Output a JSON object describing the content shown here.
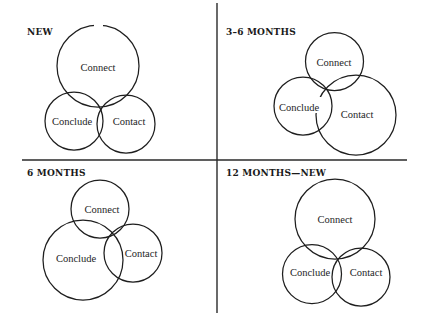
{
  "panels": [
    {
      "title": "NEW",
      "circles": [
        {
          "label": "Connect",
          "cx": 98,
          "cy": 66,
          "r": 41,
          "tx": 98,
          "ty": 71
        },
        {
          "label": "Conclude",
          "cx": 74,
          "cy": 121,
          "r": 29,
          "tx": 72,
          "ty": 125
        },
        {
          "label": "Contact",
          "cx": 126,
          "cy": 124,
          "r": 29,
          "tx": 129,
          "ty": 125
        }
      ]
    },
    {
      "title": "3–6 MONTHS",
      "circles": [
        {
          "label": "Connect",
          "cx": 334.5,
          "cy": 61.5,
          "r": 29,
          "tx": 334,
          "ty": 66
        },
        {
          "label": "Conclude",
          "cx": 303,
          "cy": 106,
          "r": 29,
          "tx": 299,
          "ty": 111
        },
        {
          "label": "Contact",
          "cx": 356,
          "cy": 115,
          "r": 40,
          "tx": 357,
          "ty": 118
        }
      ]
    },
    {
      "title": "6 MONTHS",
      "circles": [
        {
          "label": "Connect",
          "cx": 100,
          "cy": 209,
          "r": 29,
          "tx": 102,
          "ty": 213
        },
        {
          "label": "Conclude",
          "cx": 83,
          "cy": 260,
          "r": 40,
          "tx": 76,
          "ty": 262
        },
        {
          "label": "Contact",
          "cx": 133,
          "cy": 253,
          "r": 29,
          "tx": 141,
          "ty": 257
        }
      ]
    },
    {
      "title": "12 MONTHS—NEW",
      "circles": [
        {
          "label": "Connect",
          "cx": 335,
          "cy": 219,
          "r": 40,
          "tx": 335,
          "ty": 223
        },
        {
          "label": "Conclude",
          "cx": 312,
          "cy": 274,
          "r": 29.5,
          "tx": 310,
          "ty": 276
        },
        {
          "label": "Contact",
          "cx": 361,
          "cy": 277,
          "r": 29,
          "tx": 366,
          "ty": 276
        }
      ]
    }
  ],
  "dividers": {
    "horizontal": {
      "x1": 22,
      "y1": 160,
      "x2": 407,
      "y2": 160
    },
    "vertical": {
      "x1": 217,
      "y1": 3,
      "x2": 217,
      "y2": 313
    }
  },
  "colors": {
    "stroke": "#1e1e1e",
    "background": "#ffffff"
  }
}
